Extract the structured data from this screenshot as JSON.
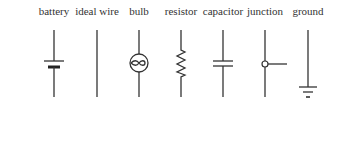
{
  "diagram": {
    "symbols": [
      {
        "id": "battery",
        "label": "battery",
        "x": 54
      },
      {
        "id": "ideal-wire",
        "label": "ideal wire",
        "x": 97
      },
      {
        "id": "bulb",
        "label": "bulb",
        "x": 139
      },
      {
        "id": "resistor",
        "label": "resistor",
        "x": 181
      },
      {
        "id": "capacitor",
        "label": "capacitor",
        "x": 223
      },
      {
        "id": "junction",
        "label": "junction",
        "x": 265
      },
      {
        "id": "ground",
        "label": "ground",
        "x": 308
      }
    ],
    "stroke_color": "#333333",
    "background": "#ffffff"
  }
}
